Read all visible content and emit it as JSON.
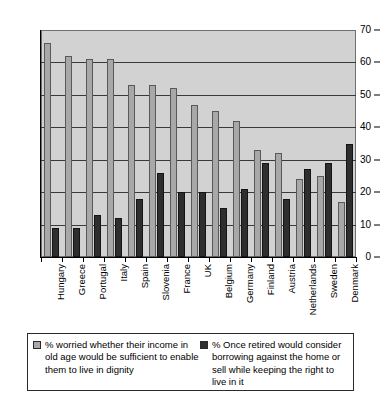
{
  "chart_data": {
    "type": "bar",
    "title": "",
    "xlabel": "",
    "ylabel": "",
    "ylim": [
      0,
      70
    ],
    "yticks": [
      0,
      10,
      20,
      30,
      40,
      50,
      60,
      70
    ],
    "grid": true,
    "legend_position": "bottom",
    "categories": [
      "Hungary",
      "Greece",
      "Portugal",
      "Italy",
      "Spain",
      "Slovenia",
      "France",
      "UK",
      "Belgium",
      "Germany",
      "Finland",
      "Austria",
      "Netherlands",
      "Sweden",
      "Denmark"
    ],
    "series": [
      {
        "name": "% worried whether their income in old age would be sufficient to enable them to live in dignity",
        "color": "#a8a8a8",
        "values": [
          66,
          62,
          61,
          61,
          53,
          53,
          52,
          47,
          45,
          42,
          33,
          32,
          24,
          25,
          17
        ]
      },
      {
        "name": "% Once retired would consider borrowing against the home or sell while keeping the right to live in it",
        "color": "#2e2e2e",
        "values": [
          9,
          9,
          13,
          12,
          18,
          26,
          20,
          20,
          15,
          21,
          29,
          18,
          27,
          29,
          35
        ]
      }
    ]
  },
  "legend": {
    "items": [
      {
        "label": "% worried whether their income in old age would be sufficient to enable them to live in dignity",
        "swatch": "light"
      },
      {
        "label": "% Once retired would consider borrowing against the home or sell while keeping the right to live in it",
        "swatch": "dark"
      }
    ]
  },
  "colors": {
    "series_light": "#a8a8a8",
    "series_dark": "#2e2e2e",
    "plot_background": "#d2d2d2",
    "gridline": "#3a3a3a",
    "axis": "#000000"
  }
}
